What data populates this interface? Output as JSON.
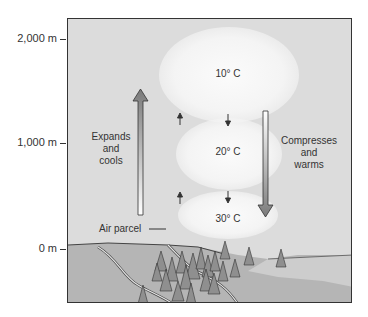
{
  "axis": {
    "ticks": [
      {
        "label": "2,000 m",
        "y": 39
      },
      {
        "label": "1,000 m",
        "y": 143
      },
      {
        "label": "0 m",
        "y": 249
      }
    ]
  },
  "clouds": [
    {
      "label": "10° C"
    },
    {
      "label": "20° C"
    },
    {
      "label": "30° C"
    }
  ],
  "left_arrow": {
    "label_lines": [
      "Expands",
      "and",
      "cools"
    ],
    "direction": "up"
  },
  "right_arrow": {
    "label_lines": [
      "Compresses",
      "and",
      "warms"
    ],
    "direction": "down"
  },
  "air_parcel_label": "Air parcel",
  "colors": {
    "sky": "#dcdcdc",
    "cloud": "#f7f7f7",
    "ground": "#b8b8b8",
    "water": "#cfcfcf",
    "trees": "#8a8a8a"
  }
}
